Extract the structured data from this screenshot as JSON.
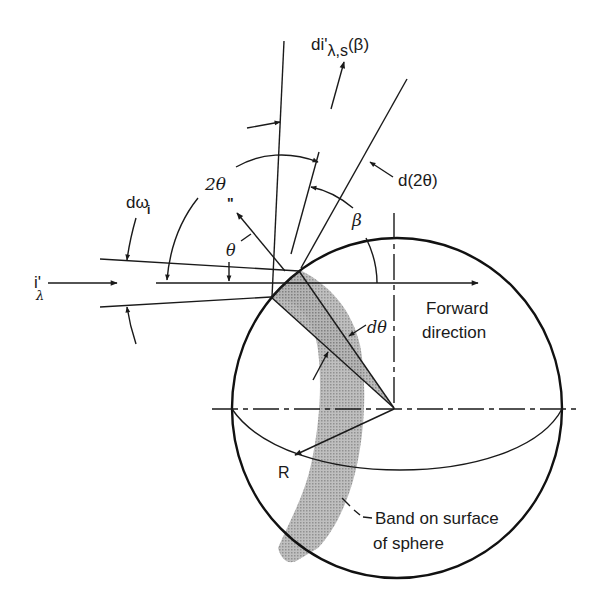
{
  "figure": {
    "colors": {
      "ink": "#1a1a1a",
      "band": "#9a9a9a",
      "background": "#ffffff"
    },
    "labels": {
      "incident_intensity": "i'",
      "incident_intensity_sub": "λ",
      "solid_angle": "dω",
      "solid_angle_sub": "i",
      "two_theta": "2θ",
      "normal_mark": "n",
      "theta": "θ",
      "scattered_intensity_main": "di'",
      "scattered_intensity_sub": "λ,s",
      "scattered_intensity_arg": "(β)",
      "d_two_theta": "d(2θ)",
      "beta": "β",
      "d_theta": "dθ",
      "forward_line1": "Forward",
      "forward_line2": "direction",
      "radius": "R",
      "band_line1": "Band on surface",
      "band_line2": "of sphere"
    }
  }
}
